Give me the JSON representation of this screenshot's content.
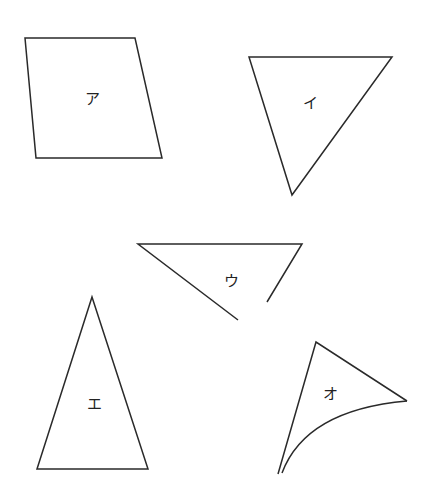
{
  "figure": {
    "stroke_color": "#2a2a2a",
    "shapes": [
      {
        "id": "a",
        "label": "ア",
        "kind": "quadrilateral"
      },
      {
        "id": "i",
        "label": "イ",
        "kind": "triangle"
      },
      {
        "id": "u",
        "label": "ウ",
        "kind": "open triangle"
      },
      {
        "id": "e",
        "label": "エ",
        "kind": "isosceles triangle"
      },
      {
        "id": "o",
        "label": "オ",
        "kind": "curved-side triangle"
      }
    ]
  }
}
